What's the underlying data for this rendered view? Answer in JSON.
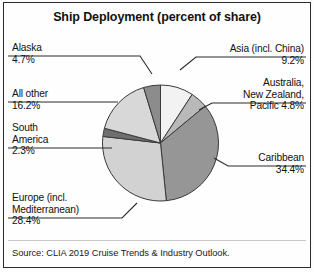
{
  "chart": {
    "title": "Ship Deployment (percent of share)",
    "source": "Source: CLIA 2019 Cruise Trends & Industry Outlook."
  },
  "labels": {
    "alaska_name": "Alaska",
    "alaska_value": "4.7%",
    "allother_name": "All other",
    "allother_value": "16.2%",
    "southamerica_name1": "South",
    "southamerica_name2": "America",
    "southamerica_value": "2.3%",
    "europe_name1": "Europe (incl.",
    "europe_name2": "Mediterranean)",
    "europe_value": "28.4%",
    "asia_name": "Asia (incl. China)",
    "asia_value": "9.2%",
    "australia_name1": "Australia,",
    "australia_name2": "New Zealand,",
    "australia_name3": "Pacific 4.8%",
    "caribbean_name": "Caribbean",
    "caribbean_value": "34.4%"
  },
  "chart_data": {
    "type": "pie",
    "title": "Ship Deployment (percent of share)",
    "unit": "percent of share",
    "legend": "none (direct labels with leader lines)",
    "start_angle_deg": 0,
    "direction": "clockwise",
    "categories": [
      "Asia (incl. China)",
      "Australia, New Zealand, Pacific",
      "Caribbean",
      "Europe (incl. Mediterranean)",
      "South America",
      "All other",
      "Alaska"
    ],
    "values": [
      9.2,
      4.8,
      34.4,
      28.4,
      2.3,
      16.2,
      4.7
    ],
    "labels": [
      "9.2%",
      "4.8%",
      "34.4%",
      "28.4%",
      "2.3%",
      "16.2%",
      "4.7%"
    ],
    "colors": [
      "#f2f2f2",
      "#b9b9b9",
      "#969696",
      "#d2d2d2",
      "#6e6e6e",
      "#d8d8d8",
      "#8c8c8c"
    ],
    "total": 100.0,
    "source": "Source: CLIA 2019 Cruise Trends & Industry Outlook."
  }
}
